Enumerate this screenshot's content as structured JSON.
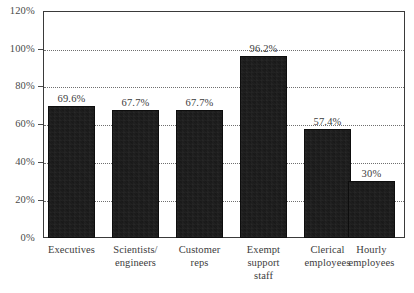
{
  "chart_data": {
    "type": "bar",
    "title": "",
    "subtitle": "",
    "xlabel": "",
    "ylabel": "",
    "categories": [
      "Executives",
      "Scientists/ engineers",
      "Customer reps",
      "Exempt support staff",
      "Clerical employees",
      "Hourly employees"
    ],
    "category_lines": [
      [
        "Executives"
      ],
      [
        "Scientists/",
        "engineers"
      ],
      [
        "Customer",
        "reps"
      ],
      [
        "Exempt",
        "support",
        "staff"
      ],
      [
        "Clerical",
        "employees"
      ],
      [
        "Hourly",
        "employees"
      ]
    ],
    "values": [
      69.6,
      67.7,
      67.7,
      96.2,
      57.4,
      30
    ],
    "value_labels": [
      "69.6%",
      "67.7%",
      "67.7%",
      "96.2%",
      "57.4%",
      "30%"
    ],
    "ylim": [
      0,
      120
    ],
    "yticks": [
      0,
      20,
      40,
      60,
      80,
      100,
      120
    ],
    "ytick_labels": [
      "0%",
      "20%",
      "40%",
      "60%",
      "80%",
      "100%",
      "120%"
    ],
    "grid": true,
    "grid_style": "dotted",
    "legend": "none",
    "bar_color": "#181818",
    "text_color": "#3c3c3c",
    "grid_color": "#6f6f6f",
    "frame_color": "#3a3a3a",
    "background": "#ffffff"
  }
}
